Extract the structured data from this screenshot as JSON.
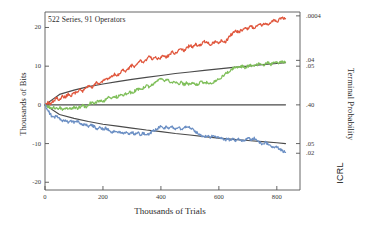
{
  "annotation": "522 Series, 91 Operators",
  "corner_mark": "ICRL",
  "chart_data": {
    "type": "line",
    "title": "",
    "annotation": "522 Series, 91 Operators",
    "xlabel": "Thousands of Trials",
    "ylabel": "Thousands of Bits",
    "ylabel_right": "Terminal Probability",
    "xlim": [
      0,
      880
    ],
    "ylim": [
      -22,
      24
    ],
    "xticks": [
      0,
      200,
      400,
      600,
      800
    ],
    "xticklabels": [
      "0",
      "200",
      "400",
      "600",
      "800"
    ],
    "yticks": [
      20,
      10,
      0,
      -10,
      -20
    ],
    "yticklabels": [
      "20",
      "10",
      "0",
      "-10",
      "-20"
    ],
    "right_axis": {
      "label": "Terminal Probability",
      "tick_values": [
        23.0,
        11.5,
        10.0,
        0.0,
        -10.0,
        -12.5
      ],
      "tick_labels": [
        ".0004",
        ".04",
        ".05",
        ".40",
        ".05",
        ".02"
      ]
    },
    "grid": false,
    "legend": "none",
    "series": [
      {
        "name": "high-intention",
        "color": "#e0563c",
        "description": "cumulative deviation trending upward",
        "x": [
          0,
          10,
          20,
          30,
          40,
          50,
          60,
          70,
          80,
          90,
          100,
          110,
          120,
          130,
          140,
          150,
          160,
          170,
          180,
          190,
          200,
          210,
          220,
          230,
          240,
          250,
          260,
          270,
          280,
          290,
          300,
          310,
          320,
          330,
          340,
          350,
          360,
          370,
          380,
          390,
          400,
          410,
          420,
          430,
          440,
          450,
          460,
          470,
          480,
          490,
          500,
          510,
          520,
          530,
          540,
          550,
          560,
          570,
          580,
          590,
          600,
          610,
          620,
          630,
          640,
          650,
          660,
          670,
          680,
          690,
          700,
          710,
          720,
          730,
          740,
          750,
          760,
          770,
          780,
          790,
          800,
          810,
          820,
          830
        ],
        "y": [
          0,
          0.6,
          0.3,
          1.0,
          1.8,
          1.4,
          2.2,
          2.0,
          2.8,
          2.4,
          3.2,
          3.0,
          3.9,
          3.4,
          4.3,
          4.9,
          4.4,
          5.2,
          5.8,
          5.4,
          6.2,
          7.0,
          6.5,
          7.4,
          8.0,
          7.6,
          8.4,
          9.1,
          8.7,
          9.5,
          10.2,
          9.8,
          10.7,
          11.4,
          11.0,
          11.8,
          12.4,
          11.9,
          12.6,
          11.8,
          12.2,
          12.8,
          12.3,
          13.0,
          13.6,
          13.2,
          13.9,
          14.5,
          14.1,
          14.8,
          15.4,
          15.0,
          15.6,
          15.1,
          15.7,
          16.3,
          16.0,
          15.6,
          16.1,
          16.4,
          16.0,
          16.6,
          16.2,
          16.8,
          18.0,
          18.6,
          19.2,
          18.8,
          19.4,
          20.0,
          19.6,
          20.3,
          19.9,
          20.5,
          21.0,
          20.6,
          21.2,
          20.8,
          21.4,
          21.9,
          21.5,
          22.1,
          22.6,
          22.3
        ]
      },
      {
        "name": "baseline",
        "color": "#7fbf5a",
        "description": "cumulative deviation mildly upward",
        "x": [
          0,
          10,
          20,
          30,
          40,
          50,
          60,
          70,
          80,
          90,
          100,
          110,
          120,
          130,
          140,
          150,
          160,
          170,
          180,
          190,
          200,
          210,
          220,
          230,
          240,
          250,
          260,
          270,
          280,
          290,
          300,
          310,
          320,
          330,
          340,
          350,
          360,
          370,
          380,
          390,
          400,
          410,
          420,
          430,
          440,
          450,
          460,
          470,
          480,
          490,
          500,
          510,
          520,
          530,
          540,
          550,
          560,
          570,
          580,
          590,
          600,
          610,
          620,
          630,
          640,
          650,
          660,
          670,
          680,
          690,
          700,
          710,
          720,
          730,
          740,
          750,
          760,
          770,
          780,
          790,
          800,
          810,
          820,
          830
        ],
        "y": [
          0,
          -0.4,
          -0.8,
          -0.5,
          -1.0,
          -0.7,
          -1.1,
          -0.8,
          -1.2,
          -0.9,
          -0.6,
          -0.9,
          -0.5,
          -0.2,
          -0.6,
          0.2,
          0.6,
          0.2,
          0.8,
          1.2,
          0.8,
          1.5,
          2.0,
          1.6,
          2.2,
          2.0,
          2.6,
          2.3,
          2.9,
          3.4,
          3.0,
          3.6,
          4.1,
          3.8,
          4.4,
          5.0,
          4.6,
          5.2,
          5.8,
          6.2,
          6.6,
          6.2,
          6.6,
          6.1,
          5.6,
          5.9,
          5.4,
          5.8,
          5.3,
          5.7,
          5.2,
          5.6,
          5.1,
          5.5,
          5.9,
          5.5,
          5.9,
          5.4,
          5.8,
          6.2,
          6.6,
          7.2,
          7.8,
          8.4,
          9.0,
          9.6,
          10.0,
          9.6,
          10.0,
          9.7,
          10.0,
          10.2,
          9.9,
          10.3,
          10.6,
          10.2,
          10.6,
          10.9,
          10.5,
          10.9,
          11.2,
          10.8,
          11.2,
          11.0
        ]
      },
      {
        "name": "low-intention",
        "color": "#6b8fc4",
        "description": "cumulative deviation trending downward",
        "x": [
          0,
          10,
          20,
          30,
          40,
          50,
          60,
          70,
          80,
          90,
          100,
          110,
          120,
          130,
          140,
          150,
          160,
          170,
          180,
          190,
          200,
          210,
          220,
          230,
          240,
          250,
          260,
          270,
          280,
          290,
          300,
          310,
          320,
          330,
          340,
          350,
          360,
          370,
          380,
          390,
          400,
          410,
          420,
          430,
          440,
          450,
          460,
          470,
          480,
          490,
          500,
          510,
          520,
          530,
          540,
          550,
          560,
          570,
          580,
          590,
          600,
          610,
          620,
          630,
          640,
          650,
          660,
          670,
          680,
          690,
          700,
          710,
          720,
          730,
          740,
          750,
          760,
          770,
          780,
          790,
          800,
          810,
          820,
          830
        ],
        "y": [
          0,
          -1.4,
          -2.6,
          -3.4,
          -2.9,
          -3.6,
          -4.2,
          -3.8,
          -4.4,
          -4.0,
          -4.6,
          -4.2,
          -4.8,
          -5.3,
          -4.9,
          -5.5,
          -5.1,
          -5.7,
          -6.2,
          -5.8,
          -6.4,
          -6.0,
          -6.6,
          -7.1,
          -6.7,
          -7.3,
          -6.9,
          -7.4,
          -7.0,
          -7.5,
          -7.1,
          -7.6,
          -7.2,
          -7.7,
          -7.3,
          -7.8,
          -7.4,
          -6.9,
          -6.4,
          -6.0,
          -5.6,
          -6.0,
          -5.6,
          -6.1,
          -5.7,
          -6.2,
          -5.8,
          -6.3,
          -5.9,
          -5.5,
          -5.9,
          -6.4,
          -6.9,
          -7.4,
          -7.9,
          -8.3,
          -7.9,
          -8.4,
          -8.0,
          -8.5,
          -8.1,
          -8.6,
          -9.1,
          -8.7,
          -9.2,
          -8.8,
          -9.3,
          -8.9,
          -9.4,
          -9.0,
          -8.6,
          -9.0,
          -8.6,
          -9.1,
          -9.6,
          -10.1,
          -9.7,
          -10.2,
          -10.7,
          -11.2,
          -10.8,
          -11.4,
          -11.9,
          -12.3
        ]
      }
    ],
    "envelopes": [
      {
        "name": "upper-significance-envelope",
        "color": "#4a4a4a",
        "description": "parabolic +sigma terminal probability envelope",
        "x": [
          0,
          50,
          100,
          150,
          200,
          250,
          300,
          350,
          400,
          450,
          500,
          550,
          600,
          650,
          700,
          750,
          800,
          830
        ],
        "y": [
          0,
          2.7,
          3.8,
          4.7,
          5.4,
          6.0,
          6.6,
          7.1,
          7.6,
          8.1,
          8.5,
          8.9,
          9.3,
          9.7,
          10.0,
          10.4,
          10.7,
          10.9
        ]
      },
      {
        "name": "zero-baseline",
        "color": "#4a4a4a",
        "description": "chance expectation line",
        "x": [
          0,
          830
        ],
        "y": [
          0,
          0
        ]
      },
      {
        "name": "lower-significance-envelope",
        "color": "#4a4a4a",
        "description": "parabolic -sigma terminal probability envelope",
        "x": [
          0,
          50,
          100,
          150,
          200,
          250,
          300,
          350,
          400,
          450,
          500,
          550,
          600,
          650,
          700,
          750,
          800,
          830
        ],
        "y": [
          0,
          -2.5,
          -3.5,
          -4.3,
          -5.0,
          -5.5,
          -6.0,
          -6.5,
          -6.9,
          -7.4,
          -7.8,
          -8.2,
          -8.6,
          -8.9,
          -9.2,
          -9.5,
          -9.8,
          -10.0
        ]
      }
    ]
  }
}
